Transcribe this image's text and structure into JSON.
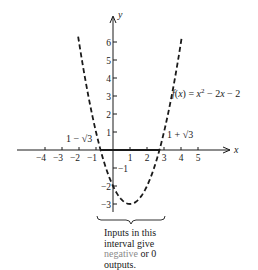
{
  "chart_data": {
    "type": "line",
    "title": "",
    "function_label": "f(x) = x² − 2x − 2",
    "xlabel": "x",
    "ylabel": "y",
    "xlim": [
      -4.5,
      6.5
    ],
    "ylim": [
      -3.5,
      7.5
    ],
    "x_ticks": [
      -4,
      -3,
      -2,
      -1,
      1,
      2,
      3,
      4,
      5
    ],
    "x_tick_labels": [
      "−4",
      "−3",
      "−2",
      "−1",
      "1",
      "2",
      "3",
      "4",
      "5"
    ],
    "y_ticks": [
      -3,
      -2,
      -1,
      1,
      2,
      3,
      4,
      5,
      6
    ],
    "y_tick_labels": [
      "−3",
      "−2",
      "−1",
      "1",
      "2",
      "3",
      "4",
      "5",
      "6"
    ],
    "series": [
      {
        "name": "f(x) = x^2 - 2x - 2",
        "style": "dashed",
        "x": [
          -2,
          -1.5,
          -1,
          -0.732,
          -0.5,
          0,
          0.5,
          1,
          1.5,
          2,
          2.5,
          2.732,
          3,
          3.5,
          4
        ],
        "y": [
          6,
          3.25,
          1,
          0,
          -0.75,
          -2,
          -2.75,
          -3,
          -2.75,
          -2,
          -0.75,
          0,
          1,
          3.25,
          6
        ]
      }
    ],
    "annotations": [
      {
        "text": "1 − √3",
        "x": -0.732,
        "y": 0
      },
      {
        "text": "1 + √3",
        "x": 2.732,
        "y": 0
      },
      {
        "text": "Inputs in this interval give negative or 0 outputs.",
        "interval": [
          -0.732,
          2.732
        ]
      }
    ],
    "grid": false,
    "legend": "none"
  },
  "labels": {
    "x_axis": "x",
    "y_axis": "y",
    "root_left": "1 − √3",
    "root_right": "1 + √3",
    "fn_prefix": "f(x) = x",
    "fn_exp": "2",
    "fn_suffix": " − 2x − 2",
    "caption_line1": "Inputs in this",
    "caption_line2": "interval give",
    "caption_neg": "negative",
    "caption_or": " or 0",
    "caption_line4": "outputs."
  }
}
